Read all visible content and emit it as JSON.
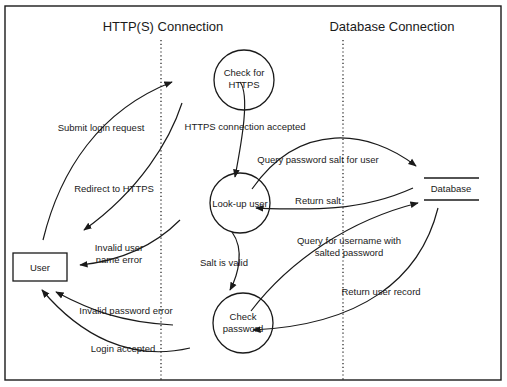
{
  "diagram": {
    "type": "data-flow-diagram",
    "lanes": [
      {
        "id": "http",
        "title": "HTTP(S) Connection"
      },
      {
        "id": "db",
        "title": "Database Connection"
      }
    ],
    "nodes": {
      "user": {
        "label": "User",
        "shape": "rectangle"
      },
      "check_https": {
        "lines": [
          "Check for",
          "HTTPS"
        ],
        "shape": "circle"
      },
      "lookup_user": {
        "label": "Look-up user",
        "shape": "circle"
      },
      "check_password": {
        "lines": [
          "Check",
          "password"
        ],
        "shape": "circle"
      },
      "database": {
        "label": "Database",
        "shape": "data-store"
      }
    },
    "flows": {
      "submit_login": {
        "label": "Submit login request",
        "from": "User",
        "to": "Check for HTTPS"
      },
      "redirect_https": {
        "label": "Redirect to HTTPS",
        "from": "Check for HTTPS",
        "to": "User"
      },
      "https_accepted": {
        "label": "HTTPS connection accepted",
        "from": "Check for HTTPS",
        "to": "Look-up user"
      },
      "invalid_user": {
        "lines": [
          "Invalid user",
          "name error"
        ],
        "from": "Look-up user",
        "to": "User"
      },
      "query_salt": {
        "label": "Query password salt for user",
        "from": "Look-up user",
        "to": "Database"
      },
      "return_salt": {
        "label": "Return salt",
        "from": "Database",
        "to": "Look-up user"
      },
      "salt_valid": {
        "label": "Salt is valid",
        "from": "Look-up user",
        "to": "Check password"
      },
      "query_username": {
        "lines": [
          "Query for username with",
          "salted password"
        ],
        "from": "Check password",
        "to": "Database"
      },
      "return_record": {
        "label": "Return user record",
        "from": "Database",
        "to": "Check password"
      },
      "invalid_password": {
        "label": "Invalid password error",
        "from": "Check password",
        "to": "User"
      },
      "login_accepted": {
        "label": "Login accepted",
        "from": "Check password",
        "to": "User"
      }
    },
    "colors": {
      "stroke": "#1a1a1a",
      "background": "#ffffff"
    }
  }
}
